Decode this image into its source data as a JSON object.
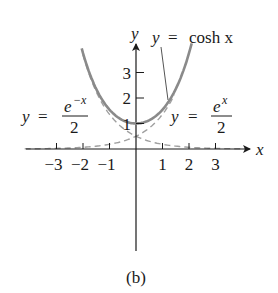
{
  "caption": "(b)",
  "axes": {
    "x_label": "x",
    "y_label": "y",
    "x_ticks": [
      "-3",
      "-2",
      "-1",
      "1",
      "2",
      "3"
    ],
    "x_tick_values": [
      -3,
      -2,
      -1,
      1,
      2,
      3
    ],
    "y_ticks": [
      "1",
      "2",
      "3"
    ],
    "y_tick_values": [
      1,
      2,
      3
    ]
  },
  "labels": {
    "cosh": {
      "lhs": "y",
      "eq": "=",
      "rhs": "cosh x"
    },
    "emx": {
      "lhs": "y",
      "eq": "=",
      "num": "e",
      "sup": "−x",
      "den": "2"
    },
    "ex": {
      "lhs": "y",
      "eq": "=",
      "num": "e",
      "sup": "x",
      "den": "2"
    }
  },
  "colors": {
    "axis": "#1a1a1a",
    "cosh_curve": "#8a8a8a",
    "exp_dashed": "#a0a0a0",
    "text": "#1a1a1a"
  },
  "chart_data": {
    "type": "line",
    "title": "",
    "caption": "(b)",
    "xlabel": "x",
    "ylabel": "y",
    "xlim": [
      -4.4,
      4.0
    ],
    "ylim": [
      -4.0,
      4.2
    ],
    "grid": false,
    "legend": "inline annotations",
    "series": [
      {
        "name": "y = cosh x",
        "style": "solid",
        "x": [
          -2.05,
          -1.5,
          -1.0,
          -0.5,
          0,
          0.5,
          1.0,
          1.5,
          2.1
        ],
        "values": [
          3.95,
          2.35,
          1.54,
          1.13,
          1.0,
          1.13,
          1.54,
          2.35,
          4.14
        ]
      },
      {
        "name": "y = e^-x / 2",
        "style": "dashed",
        "x": [
          -2.05,
          -1.5,
          -1.0,
          -0.5,
          0,
          1,
          2,
          3,
          4
        ],
        "values": [
          3.88,
          2.24,
          1.36,
          0.82,
          0.5,
          0.18,
          0.07,
          0.02,
          0.01
        ]
      },
      {
        "name": "y = e^x / 2",
        "style": "dashed",
        "x": [
          -4.4,
          -3,
          -2,
          -1,
          0,
          0.5,
          1.0,
          1.5
        ],
        "values": [
          0.01,
          0.02,
          0.07,
          0.18,
          0.5,
          0.82,
          1.36,
          2.24
        ]
      }
    ],
    "annotations": [
      "y = cosh x",
      "y = e^-x / 2",
      "y = e^x / 2",
      "(b)"
    ]
  }
}
